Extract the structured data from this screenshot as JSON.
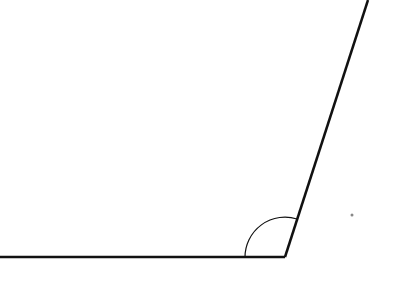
{
  "diagram": {
    "type": "angle",
    "canvas": {
      "width": 408,
      "height": 308,
      "background": "#ffffff"
    },
    "stroke_color": "#111111",
    "vertex": {
      "x": 285,
      "y": 257
    },
    "rays": [
      {
        "name": "horizontal-ray",
        "from": {
          "x": 285,
          "y": 257
        },
        "to": {
          "x": 0,
          "y": 257
        },
        "stroke_width": 2.5
      },
      {
        "name": "slanted-ray",
        "from": {
          "x": 285,
          "y": 257
        },
        "to": {
          "x": 368,
          "y": 0
        },
        "stroke_width": 2.5
      }
    ],
    "angle_arc": {
      "center": {
        "x": 285,
        "y": 257
      },
      "radius": 40,
      "start": {
        "x": 245,
        "y": 257
      },
      "end": {
        "x": 297,
        "y": 219
      },
      "stroke_width": 1.2
    },
    "point": {
      "x": 352,
      "y": 215,
      "radius": 1.5,
      "color": "#888888"
    }
  }
}
